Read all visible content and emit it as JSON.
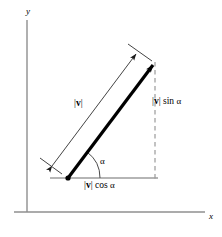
{
  "figure": {
    "type": "vector-decomposition-diagram",
    "axes": {
      "y_label": "y",
      "x_label": "x",
      "origin_px": [
        27,
        212
      ],
      "y_axis_top_px": [
        27,
        20
      ],
      "x_axis_right_px": [
        205,
        212
      ]
    },
    "labels": {
      "magnitude": {
        "bars_open": "|",
        "vector_symbol": "v",
        "bars_close": "|"
      },
      "vertical_component": {
        "bars_open": "|",
        "vector_symbol": "v",
        "bars_close": "|",
        "trig": " sin ",
        "angle": "α"
      },
      "horizontal_component": {
        "bars_open": "|",
        "vector_symbol": "v",
        "bars_close": "|",
        "trig": " cos ",
        "angle": "α"
      },
      "angle": "α"
    },
    "geometry": {
      "vector_tail_px": [
        68,
        178
      ],
      "vector_head_px": [
        155,
        62
      ],
      "baseline_start_px": [
        50,
        178
      ],
      "baseline_end_px": [
        158,
        178
      ],
      "dashed_vertical_top_px": [
        155,
        62
      ],
      "dashed_vertical_bottom_px": [
        155,
        178
      ],
      "dimension_line_start_px": [
        50,
        168
      ],
      "dimension_line_end_px": [
        137,
        52
      ],
      "angle_arc_radius_px": 30,
      "angle_degrees": 53
    },
    "colors": {
      "background": "#ffffff",
      "ink": "#000000",
      "axis": "#8a8a8a",
      "thin_line": "#4a4a4a",
      "dashed_line": "#8a8a8a"
    }
  }
}
